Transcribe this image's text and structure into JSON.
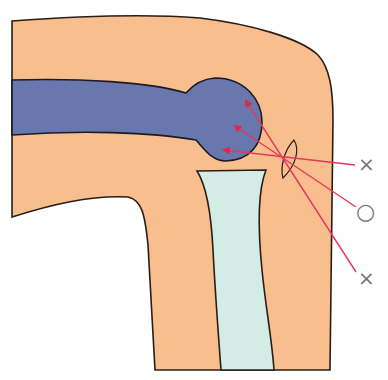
{
  "diagram": {
    "type": "anatomical-knee-injection-illustration",
    "colors": {
      "skin": "#F9BE8E",
      "femur": "#6878AE",
      "tibia": "#D4ECE6",
      "outline": "#2a1d18",
      "needle_line": "#E33A5A",
      "marker": "#808080"
    },
    "paths": [
      {
        "id": "path-upper",
        "mark": "×",
        "meaning": "incorrect"
      },
      {
        "id": "path-middle",
        "mark": "○",
        "meaning": "correct"
      },
      {
        "id": "path-lower",
        "mark": "×",
        "meaning": "incorrect"
      }
    ]
  },
  "labels": {
    "upper_mark": "×",
    "middle_mark": "○",
    "lower_mark": "×"
  }
}
